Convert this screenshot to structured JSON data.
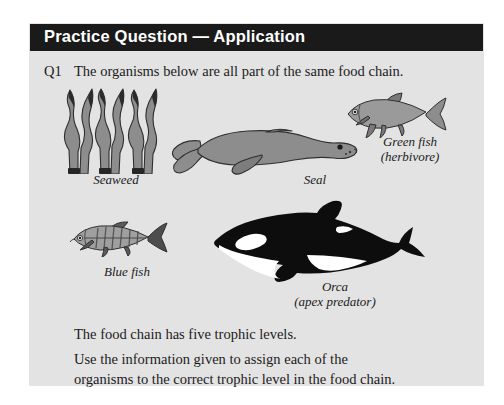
{
  "header": {
    "title": "Practice Question — Application"
  },
  "question": {
    "number": "Q1",
    "text": "The organisms below are all part of the same food chain."
  },
  "organisms": [
    {
      "id": "seaweed",
      "label": "Seaweed",
      "sublabel": "",
      "icon": "seaweed-illustration"
    },
    {
      "id": "seal",
      "label": "Seal",
      "sublabel": "",
      "icon": "seal-illustration"
    },
    {
      "id": "greenfish",
      "label": "Green fish",
      "sublabel": "(herbivore)",
      "icon": "green-fish-illustration"
    },
    {
      "id": "bluefish",
      "label": "Blue fish",
      "sublabel": "",
      "icon": "blue-fish-illustration"
    },
    {
      "id": "orca",
      "label": "Orca",
      "sublabel": "(apex predator)",
      "icon": "orca-illustration"
    }
  ],
  "instructions": {
    "line1": "The food chain has five trophic levels.",
    "line2": "Use the information given to assign each of the",
    "line3": "organisms to the correct trophic level in the food chain."
  },
  "colors": {
    "page_background": "#ffffff",
    "panel_background": "#e3e3e3",
    "header_background": "#1a1a1a",
    "header_text": "#ffffff",
    "body_text": "#1b1b1b",
    "illustration_gray": "#8d8d8d",
    "illustration_dark": "#3a3a3a",
    "orca_black": "#0d0d0d",
    "orca_white": "#ffffff"
  }
}
